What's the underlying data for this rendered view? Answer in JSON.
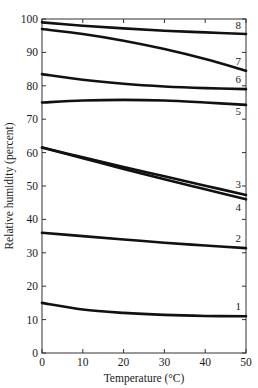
{
  "chart_data": {
    "type": "line",
    "title": "",
    "xlabel": "Temperature (°C)",
    "ylabel": "Relative humidity (percent)",
    "xlim": [
      0,
      50
    ],
    "ylim": [
      0,
      100
    ],
    "x_ticks": [
      0,
      10,
      20,
      30,
      40,
      50
    ],
    "y_ticks": [
      0,
      10,
      20,
      30,
      40,
      50,
      60,
      70,
      80,
      90,
      100
    ],
    "grid": false,
    "legend": "none (curves labeled 1-8 at right end)",
    "x": [
      0,
      10,
      20,
      30,
      40,
      50
    ],
    "series": [
      {
        "name": "1",
        "values": [
          15.0,
          13.0,
          12.0,
          11.4,
          11.1,
          11.0
        ]
      },
      {
        "name": "2",
        "values": [
          36.0,
          35.0,
          34.0,
          33.0,
          32.2,
          31.4
        ]
      },
      {
        "name": "3",
        "values": [
          61.5,
          58.6,
          55.7,
          52.9,
          50.1,
          47.3
        ]
      },
      {
        "name": "4",
        "values": [
          61.5,
          58.3,
          55.1,
          52.0,
          49.0,
          46.0
        ]
      },
      {
        "name": "5",
        "values": [
          75.0,
          75.6,
          75.8,
          75.6,
          75.0,
          74.3
        ]
      },
      {
        "name": "6",
        "values": [
          83.5,
          81.8,
          80.6,
          79.8,
          79.3,
          79.0
        ]
      },
      {
        "name": "7",
        "values": [
          97.0,
          95.5,
          93.5,
          91.0,
          88.0,
          84.5
        ]
      },
      {
        "name": "8",
        "values": [
          99.0,
          98.0,
          97.2,
          96.5,
          96.0,
          95.5
        ]
      }
    ]
  }
}
